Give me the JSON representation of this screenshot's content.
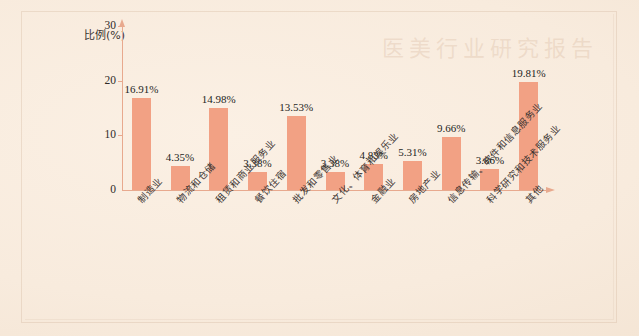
{
  "page": {
    "background_color": "#f8ebdd",
    "frame_color": "#cdaf96",
    "watermark_text": "医美行业研究报告"
  },
  "chart_data": {
    "type": "bar",
    "title": "",
    "xlabel": "",
    "ylabel": "比例(%)",
    "ylim": [
      0,
      30
    ],
    "yticks": [
      "0",
      "10",
      "20",
      "30"
    ],
    "grid": false,
    "legend": "none",
    "bar_color": "#f2a184",
    "axis_color": "#e8a98e",
    "categories": [
      "制造业",
      "物流和仓储",
      "租赁和商业服务业",
      "餐饮住宿",
      "批发和零售业",
      "文化、体育和娱乐业",
      "金融业",
      "房地产业",
      "信息传输、软件和信息服务业",
      "科学研究和技术服务业",
      "其他"
    ],
    "values": [
      16.91,
      4.35,
      14.98,
      3.38,
      13.53,
      3.38,
      4.83,
      5.31,
      9.66,
      3.86,
      19.81
    ],
    "value_labels": [
      "16.91%",
      "4.35%",
      "14.98%",
      "3.38%",
      "13.53%",
      "3.38%",
      "4.83%",
      "5.31%",
      "9.66%",
      "3.86%",
      "19.81%"
    ]
  }
}
